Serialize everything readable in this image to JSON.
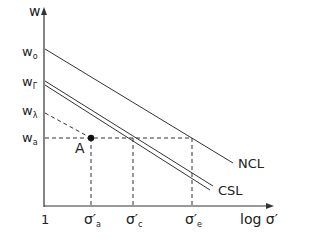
{
  "diagram": {
    "y_axis_label": "w",
    "x_axis_label": "log σ′",
    "x_origin_label": "1",
    "y_ticks": [
      {
        "main": "w",
        "sub": "o"
      },
      {
        "main": "w",
        "sub": "Γ"
      },
      {
        "main": "w",
        "sub": "λ"
      },
      {
        "main": "w",
        "sub": "a"
      }
    ],
    "x_ticks": [
      {
        "main": "σ′",
        "sub": "a"
      },
      {
        "main": "σ′",
        "sub": "c"
      },
      {
        "main": "σ′",
        "sub": "e"
      }
    ],
    "point_label": "A",
    "lines": {
      "ncl": "NCL",
      "csl": "CSL"
    },
    "colors": {
      "line": "#333333",
      "text": "#222222",
      "background": "#ffffff"
    }
  }
}
